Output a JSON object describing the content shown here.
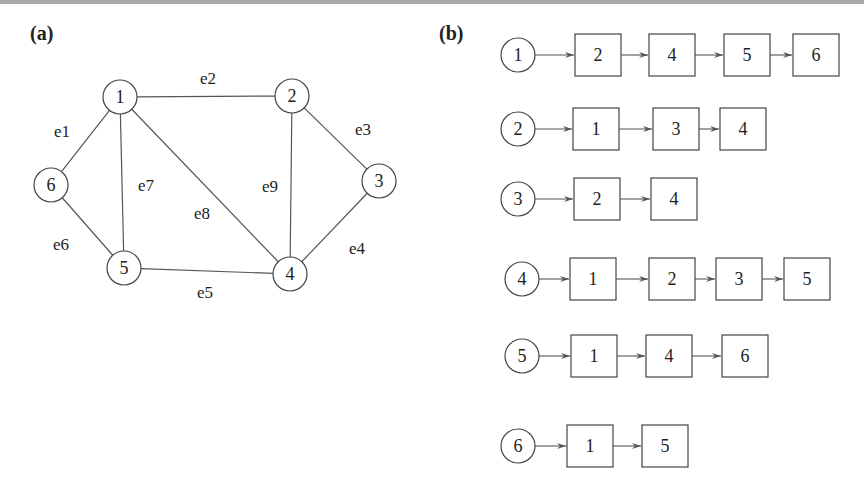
{
  "panels": {
    "a": {
      "label": "(a)"
    },
    "b": {
      "label": "(b)"
    }
  },
  "graph": {
    "nodes": [
      {
        "id": "1",
        "x": 120,
        "y": 97
      },
      {
        "id": "2",
        "x": 292,
        "y": 96
      },
      {
        "id": "3",
        "x": 379,
        "y": 181
      },
      {
        "id": "4",
        "x": 290,
        "y": 274
      },
      {
        "id": "5",
        "x": 124,
        "y": 268
      },
      {
        "id": "6",
        "x": 51,
        "y": 185
      }
    ],
    "edges": [
      {
        "name": "e1",
        "from": "1",
        "to": "6",
        "lx": 62,
        "ly": 137
      },
      {
        "name": "e2",
        "from": "1",
        "to": "2",
        "lx": 208,
        "ly": 84
      },
      {
        "name": "e3",
        "from": "2",
        "to": "3",
        "lx": 363,
        "ly": 135
      },
      {
        "name": "e4",
        "from": "3",
        "to": "4",
        "lx": 357,
        "ly": 254
      },
      {
        "name": "e5",
        "from": "5",
        "to": "4",
        "lx": 205,
        "ly": 298
      },
      {
        "name": "e6",
        "from": "6",
        "to": "5",
        "lx": 61,
        "ly": 250
      },
      {
        "name": "e7",
        "from": "1",
        "to": "5",
        "lx": 146,
        "ly": 191
      },
      {
        "name": "e8",
        "from": "1",
        "to": "4",
        "lx": 202,
        "ly": 219
      },
      {
        "name": "e9",
        "from": "2",
        "to": "4",
        "lx": 270,
        "ly": 192
      }
    ]
  },
  "adjacency_list": [
    {
      "head": "1",
      "neighbors": [
        "2",
        "4",
        "5",
        "6"
      ]
    },
    {
      "head": "2",
      "neighbors": [
        "1",
        "3",
        "4"
      ]
    },
    {
      "head": "3",
      "neighbors": [
        "2",
        "4"
      ]
    },
    {
      "head": "4",
      "neighbors": [
        "1",
        "2",
        "3",
        "5"
      ]
    },
    {
      "head": "5",
      "neighbors": [
        "1",
        "4",
        "6"
      ]
    },
    {
      "head": "6",
      "neighbors": [
        "1",
        "5"
      ]
    }
  ]
}
